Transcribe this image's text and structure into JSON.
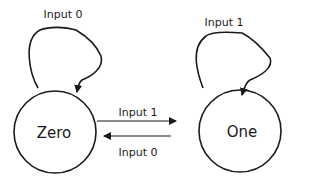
{
  "diagram": {
    "type": "finite-state-machine",
    "colors": {
      "stroke": "#1a1a1a",
      "background": "#ffffff"
    },
    "states": [
      {
        "id": "zero",
        "label": "Zero",
        "cx": 55,
        "cy": 132,
        "r": 41
      },
      {
        "id": "one",
        "label": "One",
        "cx": 240,
        "cy": 131,
        "r": 41
      }
    ],
    "transitions": [
      {
        "from": "zero",
        "to": "zero",
        "label": "Input 0"
      },
      {
        "from": "one",
        "to": "one",
        "label": "Input 1"
      },
      {
        "from": "zero",
        "to": "one",
        "label": "Input 1"
      },
      {
        "from": "one",
        "to": "zero",
        "label": "Input 0"
      }
    ]
  }
}
